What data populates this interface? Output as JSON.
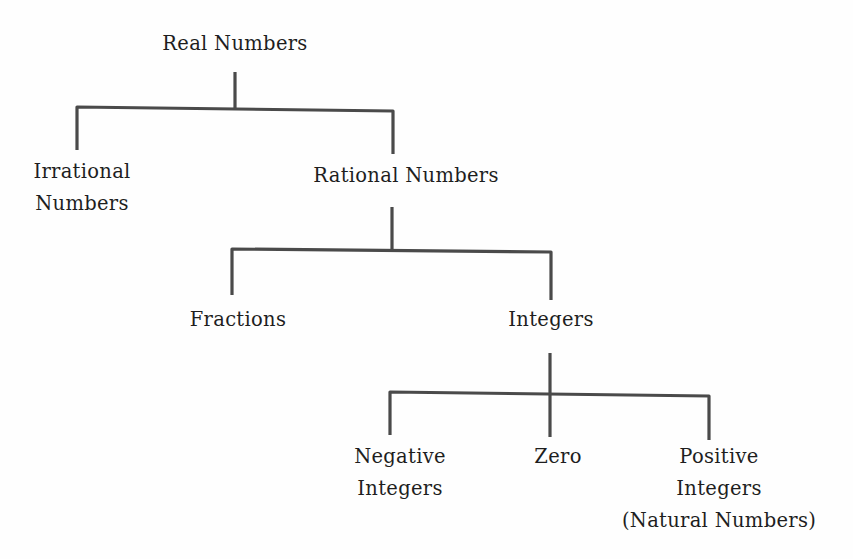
{
  "diagram": {
    "type": "tree",
    "title": "Real Numbers",
    "nodes": {
      "real": {
        "label": "Real Numbers"
      },
      "irrational": {
        "lines": [
          "Irrational",
          "Numbers"
        ]
      },
      "rational": {
        "label": "Rational Numbers"
      },
      "fractions": {
        "label": "Fractions"
      },
      "integers": {
        "label": "Integers"
      },
      "negative": {
        "lines": [
          "Negative",
          "Integers"
        ]
      },
      "zero": {
        "label": "Zero"
      },
      "positive": {
        "lines": [
          "Positive",
          "Integers",
          "(Natural Numbers)"
        ]
      }
    },
    "edges": [
      [
        "Real Numbers",
        "Irrational Numbers"
      ],
      [
        "Real Numbers",
        "Rational Numbers"
      ],
      [
        "Rational Numbers",
        "Fractions"
      ],
      [
        "Rational Numbers",
        "Integers"
      ],
      [
        "Integers",
        "Negative Integers"
      ],
      [
        "Integers",
        "Zero"
      ],
      [
        "Integers",
        "Positive Integers (Natural Numbers)"
      ]
    ],
    "line_color": "#4a4a4a",
    "text_color": "#1e1e1e"
  }
}
